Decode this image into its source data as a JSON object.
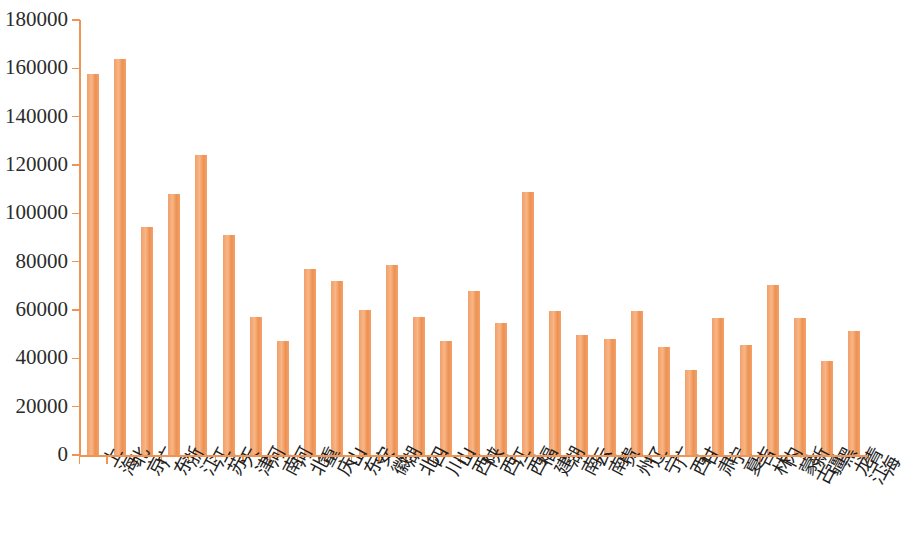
{
  "chart_data": {
    "type": "bar",
    "title": "",
    "subtitle": "",
    "xlabel": "",
    "ylabel": "",
    "ylim": [
      0,
      180000
    ],
    "ytick_step": 20000,
    "yticks": [
      0,
      20000,
      40000,
      60000,
      80000,
      100000,
      120000,
      140000,
      160000,
      180000
    ],
    "ytick_labels": [
      "0",
      "20000",
      "40000",
      "60000",
      "80000",
      "100000",
      "120000",
      "140000",
      "160000",
      "180000"
    ],
    "grid": false,
    "legend": null,
    "legend_position": "none",
    "bar_color": "#F3A068",
    "axis_color": "#EE9556",
    "text_color": "#2b2b2b",
    "background": "#ffffff",
    "categories": [
      "上海",
      "北京",
      "广东",
      "浙江",
      "江苏",
      "天津",
      "河南",
      "河北",
      "重庆",
      "山东",
      "安徽",
      "湖北",
      "四川",
      "山西",
      "陕西",
      "江西",
      "福建",
      "湖南",
      "云南",
      "贵州",
      "辽宁",
      "广西",
      "甘肃",
      "宁夏",
      "吉林",
      "内蒙古",
      "新疆",
      "黑龙江",
      "青海"
    ],
    "values": [
      157500,
      164000,
      94500,
      108000,
      124000,
      91000,
      57000,
      47000,
      77000,
      72000,
      60000,
      78500,
      57000,
      47000,
      68000,
      54500,
      109000,
      59500,
      49500,
      48000,
      59500,
      44500,
      35000,
      56500,
      45500,
      70500,
      56500,
      39000,
      51500
    ]
  }
}
